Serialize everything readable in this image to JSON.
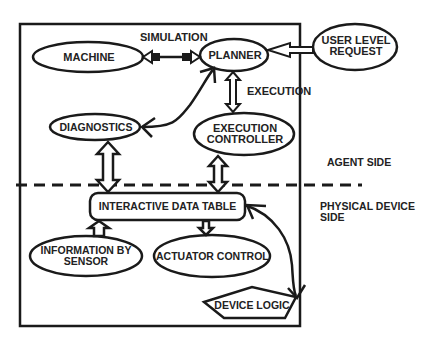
{
  "diagram": {
    "nodes": {
      "machine": "MACHINE",
      "planner": "PLANNER",
      "user_request_line1": "USER LEVEL",
      "user_request_line2": "REQUEST",
      "diagnostics": "DIAGNOSTICS",
      "exec_controller_line1": "EXECUTION",
      "exec_controller_line2": "CONTROLLER",
      "data_table": "INTERACTIVE DATA TABLE",
      "sensor_line1": "INFORMATION BY",
      "sensor_line2": "SENSOR",
      "actuator": "ACTUATOR CONTROL",
      "device_logic": "DEVICE LOGIC"
    },
    "edge_labels": {
      "simulation": "SIMULATION",
      "execution": "EXECUTION"
    },
    "regions": {
      "agent_side": "AGENT SIDE",
      "physical_line1": "PHYSICAL DEVICE",
      "physical_line2": "SIDE"
    },
    "colors": {
      "stroke": "#1a1a1a",
      "text": "#222222",
      "background": "#ffffff"
    }
  }
}
